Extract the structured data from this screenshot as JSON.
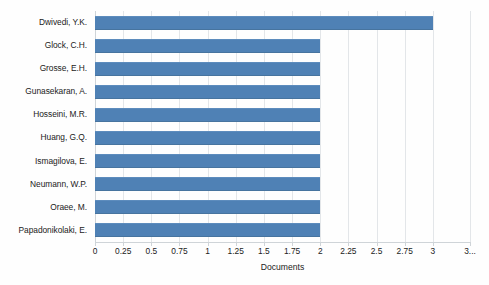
{
  "chart_data": {
    "type": "bar",
    "orientation": "horizontal",
    "title": "",
    "xlabel": "Documents",
    "ylabel": "",
    "categories": [
      "Dwivedi, Y.K.",
      "Glock, C.H.",
      "Grosse, E.H.",
      "Gunasekaran, A.",
      "Hosseini, M.R.",
      "Huang, G.Q.",
      "Ismagilova, E.",
      "Neumann, W.P.",
      "Oraee, M.",
      "Papadonikolaki, E."
    ],
    "values": [
      3,
      2,
      2,
      2,
      2,
      2,
      2,
      2,
      2,
      2
    ],
    "xlim": [
      0,
      3.33
    ],
    "xticks": [
      0,
      0.25,
      0.5,
      0.75,
      1,
      1.25,
      1.5,
      1.75,
      2,
      2.25,
      2.5,
      2.75,
      3,
      3.33
    ],
    "xtick_labels": [
      "0",
      "0.25",
      "0.5",
      "0.75",
      "1",
      "1.25",
      "1.5",
      "1.75",
      "2",
      "2.25",
      "2.5",
      "2.75",
      "3",
      "3..."
    ],
    "grid": true,
    "legend": false,
    "bar_color": "#4f81b5",
    "gridline_color": "#e3e6e9",
    "axis_color": "#cfd4d8",
    "text_color": "#222222",
    "background_color": "#fefefe"
  }
}
